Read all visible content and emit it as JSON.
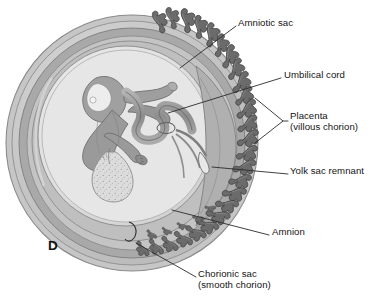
{
  "figure": {
    "panel_letter": "D",
    "kind": "medical-illustration",
    "palette": {
      "background": "#ffffff",
      "outer_rim": "#cfcfcf",
      "chorion_band": "#a8a8a8",
      "decidua_band": "#bdbdbd",
      "chorionic_cavity": "#c9c9c9",
      "amniotic_cavity": "#e3e3e3",
      "villi_dark": "#6f6f6f",
      "villi_outline": "#4a4a4a",
      "fetus_body": "#9c9c9c",
      "fetus_light": "#d4d4d4",
      "yolk_sac": "#d8d8d8",
      "leader_line": "#2b2b2b",
      "text": "#141414"
    }
  },
  "labels": [
    {
      "id": "amniotic-sac",
      "lines": [
        "Amniotic sac"
      ],
      "x": 238,
      "y": 17,
      "leader": [
        [
          236,
          26
        ],
        [
          180,
          68
        ]
      ]
    },
    {
      "id": "umbilical-cord",
      "lines": [
        "Umbilical cord"
      ],
      "x": 284,
      "y": 69,
      "leader": [
        [
          281,
          78
        ],
        [
          168,
          113
        ]
      ]
    },
    {
      "id": "placenta",
      "lines": [
        "Placenta",
        "(villous chorion)"
      ],
      "x": 290,
      "y": 110,
      "leader": [
        [
          288,
          121
        ],
        [
          283,
          121
        ]
      ],
      "bracket": [
        [
          255,
          98
        ],
        [
          283,
          121
        ],
        [
          255,
          143
        ]
      ]
    },
    {
      "id": "yolk-sac-remnant",
      "lines": [
        "Yolk sac remnant"
      ],
      "x": 290,
      "y": 165,
      "leader": [
        [
          288,
          174
        ],
        [
          212,
          167
        ]
      ]
    },
    {
      "id": "amnion",
      "lines": [
        "Amnion"
      ],
      "x": 272,
      "y": 226,
      "leader": [
        [
          269,
          235
        ],
        [
          172,
          210
        ]
      ]
    },
    {
      "id": "chorionic-sac",
      "lines": [
        "Chorionic sac",
        "(smooth chorion)"
      ],
      "x": 198,
      "y": 268,
      "leader": [
        [
          196,
          277
        ],
        [
          136,
          243
        ]
      ],
      "marker": "hook"
    }
  ]
}
